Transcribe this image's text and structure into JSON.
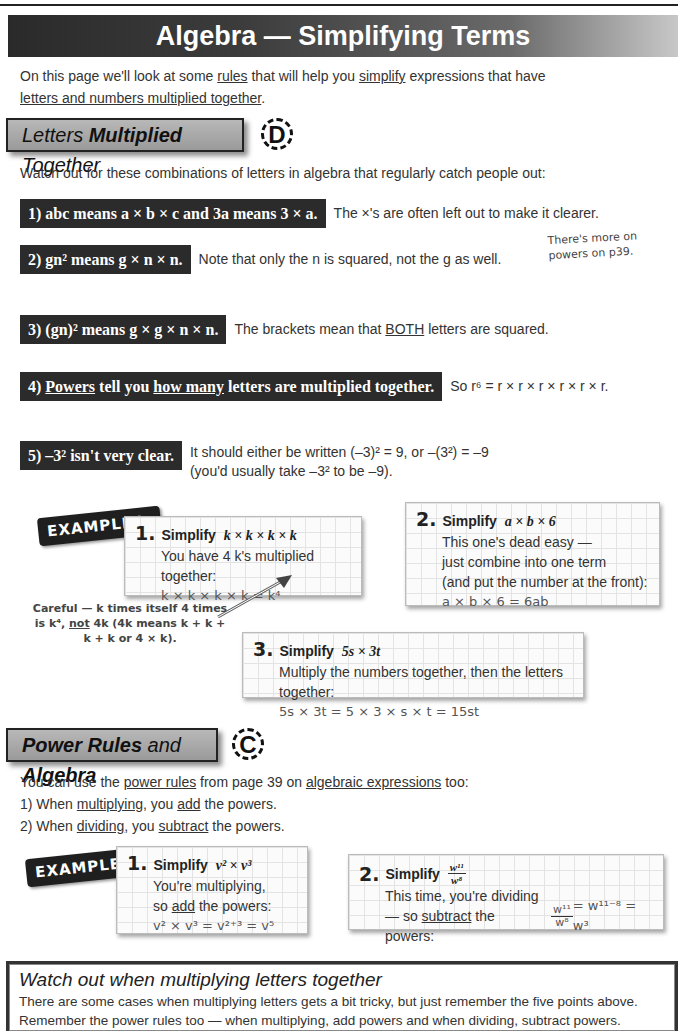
{
  "page": {
    "title": "Algebra — Simplifying Terms",
    "intro": {
      "p1": "On this page we'll look at some ",
      "rules": "rules",
      "p2": " that will help you ",
      "simplify": "simplify",
      "p3": " expressions that have",
      "underlined_line": "letters and numbers multiplied together",
      "end": "."
    }
  },
  "section1": {
    "heading_a": "Letters ",
    "heading_b": "Multiplied",
    "heading_c": " Together",
    "grade": "D",
    "lead": "Watch out for these combinations of letters in algebra that regularly catch people out:",
    "rules": [
      {
        "box": "1)  abc means a × b × c  and  3a means 3 × a.",
        "note": "The ×'s are often left out to make it clearer."
      },
      {
        "box": "2)  gn² means g × n × n.",
        "note": "Note that only the n is squared, not the g as well."
      },
      {
        "box": "3)  (gn)² means g × g × n × n.",
        "note_a": "The brackets mean that ",
        "note_u": "BOTH",
        "note_b": " letters are squared."
      },
      {
        "box_num": "4)  ",
        "box_u1": "Powers",
        "box_mid": " tell you ",
        "box_u2": "how many",
        "box_end": " letters are multiplied together.",
        "note": "So r⁶ = r × r × r × r × r × r."
      },
      {
        "box": "5)  –3² isn't very clear.",
        "note_line1": "It should either be written (–3)² = 9, or –(3²) = –9",
        "note_line2": "(you'd usually take –3² to be –9)."
      }
    ],
    "side_note": "There's more on powers on p39.",
    "examples_tag": "EXAMPLES:",
    "examples": [
      {
        "num": "1.",
        "head": "Simplify",
        "expr": "k × k × k × k",
        "line1": "You have 4 k's multiplied together:",
        "result": "k × k × k × k = k⁴"
      },
      {
        "num": "2.",
        "head": "Simplify",
        "expr": "a × b × 6",
        "line1": "This one's dead easy —",
        "line2": "just combine into one term",
        "line3": "(and put the number at the front):",
        "result": "a × b × 6 = 6ab"
      },
      {
        "num": "3.",
        "head": "Simplify",
        "expr": "5s × 3t",
        "line1": "Multiply the numbers together, then the letters together:",
        "result": "5s × 3t = 5 × 3 × s × t = 15st"
      }
    ],
    "careful_a": "Careful — k times itself 4 times is k⁴, ",
    "careful_u": "not",
    "careful_b": " 4k (4k means k + k + k + k or 4 × k)."
  },
  "section2": {
    "heading_a": "Power Rules",
    "heading_b": " and ",
    "heading_c": "Algebra",
    "grade": "C",
    "lead_a": "You can use the ",
    "lead_u1": "power rules",
    "lead_b": " from page 39 on ",
    "lead_u2": "algebraic expressions",
    "lead_c": " too:",
    "points": [
      {
        "a": "1)   When ",
        "u1": "multiplying",
        "b": ", you ",
        "u2": "add",
        "c": " the powers."
      },
      {
        "a": "2)   When ",
        "u1": "dividing",
        "b": ", you ",
        "u2": "subtract",
        "c": " the powers."
      }
    ],
    "examples_tag": "EXAMPLES:",
    "examples": [
      {
        "num": "1.",
        "head": "Simplify",
        "expr": "v² × v³",
        "line1": "You're multiplying,",
        "line2_a": "so ",
        "line2_u": "add",
        "line2_b": " the powers:",
        "result": "v² × v³ = v²⁺³ = v⁵"
      },
      {
        "num": "2.",
        "head": "Simplify",
        "expr_num": "w¹¹",
        "expr_den": "w⁸",
        "line1": "This time, you're dividing",
        "line2_a": "— so ",
        "line2_u": "subtract",
        "line2_b": " the powers:",
        "res_num": "w¹¹",
        "res_den": "w⁸",
        "result_tail": " = w¹¹⁻⁸ = w³"
      }
    ]
  },
  "summary": {
    "title": "Watch out when multiplying letters together",
    "line1": "There are some cases when multiplying letters gets a bit tricky, but just remember the five points above.",
    "line2": "Remember the power rules too — when multiplying, add powers and when dividing, subtract powers."
  }
}
